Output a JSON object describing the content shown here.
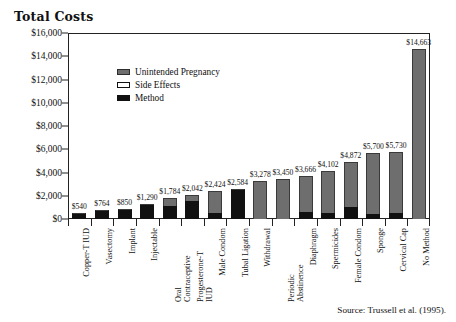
{
  "chart_data": {
    "type": "bar",
    "subtype": "stacked-bar",
    "title": "Total Costs",
    "xlabel": "",
    "ylabel": "",
    "ylim": [
      0,
      16000
    ],
    "ytick_step": 2000,
    "ytick_labels": [
      "$16,000",
      "$14,000",
      "$12,000",
      "$10,000",
      "$8,000",
      "$6,000",
      "$4,000",
      "$2,000",
      "$0"
    ],
    "ytick_values": [
      16000,
      14000,
      12000,
      10000,
      8000,
      6000,
      4000,
      2000,
      0
    ],
    "grid": false,
    "legend_position": "upper-left-inside",
    "categories": [
      "Copper-T IUD",
      "Vasectomy",
      "Implant",
      "Injectable",
      "Oral Contraceptive",
      "Progesterone-T IUD",
      "Male Condom",
      "Tubal Ligation",
      "Withdrawal",
      "Periodic Abstinence",
      "Diaphragm",
      "Spermicides",
      "Female Condom",
      "Sponge",
      "Cervical Cap",
      "No Method"
    ],
    "totals": [
      540,
      764,
      850,
      1290,
      1784,
      2042,
      2424,
      2584,
      3278,
      3450,
      3666,
      4102,
      4872,
      5700,
      5730,
      14663
    ],
    "total_labels": [
      "$540",
      "$764",
      "$850",
      "$1,290",
      "$1,784",
      "$2,042",
      "$2,424",
      "$2,584",
      "$3,278",
      "$3,450",
      "$3,666",
      "$4,102",
      "$4,872",
      "$5,700",
      "$5,730",
      "$14,663"
    ],
    "series": [
      {
        "name": "Method",
        "color": "#111111",
        "values": [
          540,
          764,
          850,
          1230,
          1130,
          1530,
          560,
          2584,
          0,
          0,
          640,
          520,
          1060,
          460,
          480,
          0
        ]
      },
      {
        "name": "Side Effects",
        "color": "#ffffff",
        "values": [
          0,
          0,
          0,
          0,
          0,
          0,
          0,
          0,
          0,
          0,
          0,
          0,
          0,
          0,
          0,
          0
        ]
      },
      {
        "name": "Unintended Pregnancy",
        "color": "#6e6e6e",
        "values": [
          0,
          0,
          0,
          60,
          654,
          512,
          1864,
          0,
          3278,
          3450,
          3026,
          3582,
          3812,
          5240,
          5250,
          14663
        ]
      }
    ]
  },
  "legend": {
    "items": [
      {
        "label": "Unintended Pregnancy",
        "swatch": "pregnancy"
      },
      {
        "label": "Side Effects",
        "swatch": "side"
      },
      {
        "label": "Method",
        "swatch": "method"
      }
    ]
  },
  "source": {
    "text": "Source: Trussell et al. (1995)."
  }
}
